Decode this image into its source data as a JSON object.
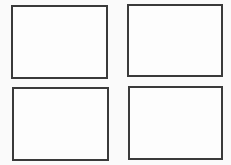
{
  "diagram": {
    "layout": "2x2 grid",
    "stroke_color": "#3a3a3a",
    "background_color": "#fafafa",
    "panels": [
      {
        "id": "top-left",
        "x": 11,
        "y": 5,
        "w": 97,
        "h": 74,
        "label": ""
      },
      {
        "id": "top-right",
        "x": 127,
        "y": 4,
        "w": 96,
        "h": 73,
        "label": ""
      },
      {
        "id": "bottom-left",
        "x": 12,
        "y": 87,
        "w": 97,
        "h": 74,
        "label": ""
      },
      {
        "id": "bottom-right",
        "x": 128,
        "y": 86,
        "w": 95,
        "h": 74,
        "label": ""
      }
    ]
  }
}
